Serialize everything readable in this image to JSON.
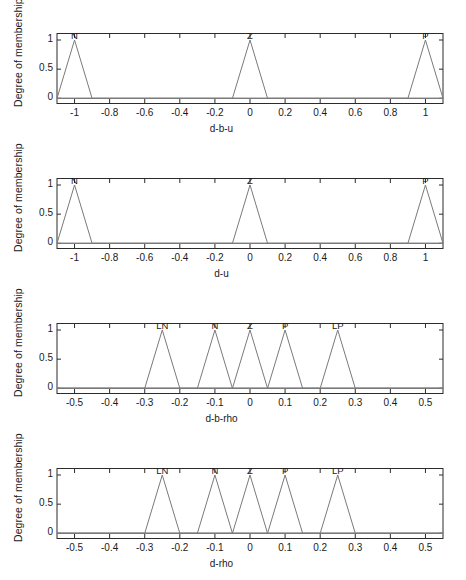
{
  "figure": {
    "background_color": "#ffffff",
    "axis_color": "#2b2b2b",
    "curve_color": "#7a7a7a",
    "baseline_color": "#9a9a9a",
    "panel_count": 4
  },
  "chart_data": [
    {
      "type": "line",
      "title": "",
      "xlabel": "d-b-u",
      "ylabel": "Degree of membership",
      "xlim": [
        -1.1,
        1.1
      ],
      "ylim": [
        -0.08,
        1.12
      ],
      "grid": false,
      "legend_position": "none",
      "xticks": [
        -1,
        -0.8,
        -0.6,
        -0.4,
        -0.2,
        0,
        0.2,
        0.4,
        0.6,
        0.8,
        1
      ],
      "xticklabels": [
        "-1",
        "-0.8",
        "-0.6",
        "-0.4",
        "-0.2",
        "0",
        "0.2",
        "0.4",
        "0.6",
        "0.8",
        "1"
      ],
      "yticks": [
        0,
        0.5,
        1
      ],
      "yticklabels": [
        "0",
        "0.5",
        "1"
      ],
      "series": [
        {
          "name": "N",
          "annotation": "N",
          "annotation_x": -1,
          "x": [
            -1.1,
            -1.0,
            -0.9,
            1.1
          ],
          "y": [
            0,
            1,
            0,
            0
          ]
        },
        {
          "name": "Z",
          "annotation": "Z",
          "annotation_x": 0,
          "x": [
            -1.1,
            -0.1,
            0.0,
            0.1,
            1.1
          ],
          "y": [
            0,
            0,
            1,
            0,
            0
          ]
        },
        {
          "name": "P",
          "annotation": "P",
          "annotation_x": 1,
          "x": [
            -1.1,
            0.9,
            1.0,
            1.1
          ],
          "y": [
            0,
            0,
            1,
            0
          ]
        }
      ]
    },
    {
      "type": "line",
      "title": "",
      "xlabel": "d-u",
      "ylabel": "Degree of membership",
      "xlim": [
        -1.1,
        1.1
      ],
      "ylim": [
        -0.08,
        1.12
      ],
      "grid": false,
      "legend_position": "none",
      "xticks": [
        -1,
        -0.8,
        -0.6,
        -0.4,
        -0.2,
        0,
        0.2,
        0.4,
        0.6,
        0.8,
        1
      ],
      "xticklabels": [
        "-1",
        "-0.8",
        "-0.6",
        "-0.4",
        "-0.2",
        "0",
        "0.2",
        "0.4",
        "0.6",
        "0.8",
        "1"
      ],
      "yticks": [
        0,
        0.5,
        1
      ],
      "yticklabels": [
        "0",
        "0.5",
        "1"
      ],
      "series": [
        {
          "name": "N",
          "annotation": "N",
          "annotation_x": -1,
          "x": [
            -1.1,
            -1.0,
            -0.9,
            1.1
          ],
          "y": [
            0,
            1,
            0,
            0
          ]
        },
        {
          "name": "Z",
          "annotation": "Z",
          "annotation_x": 0,
          "x": [
            -1.1,
            -0.1,
            0.0,
            0.1,
            1.1
          ],
          "y": [
            0,
            0,
            1,
            0,
            0
          ]
        },
        {
          "name": "P",
          "annotation": "P",
          "annotation_x": 1,
          "x": [
            -1.1,
            0.9,
            1.0,
            1.1
          ],
          "y": [
            0,
            0,
            1,
            0
          ]
        }
      ]
    },
    {
      "type": "line",
      "title": "",
      "xlabel": "d-b-rho",
      "ylabel": "Degree of membership",
      "xlim": [
        -0.55,
        0.55
      ],
      "ylim": [
        -0.08,
        1.12
      ],
      "grid": false,
      "legend_position": "none",
      "xticks": [
        -0.5,
        -0.4,
        -0.3,
        -0.2,
        -0.1,
        0,
        0.1,
        0.2,
        0.3,
        0.4,
        0.5
      ],
      "xticklabels": [
        "-0.5",
        "-0.4",
        "-0.3",
        "-0.2",
        "-0.1",
        "0",
        "0.1",
        "0.2",
        "0.3",
        "0.4",
        "0.5"
      ],
      "yticks": [
        0,
        0.5,
        1
      ],
      "yticklabels": [
        "0",
        "0.5",
        "1"
      ],
      "series": [
        {
          "name": "LN",
          "annotation": "LN",
          "annotation_x": -0.25,
          "x": [
            -0.55,
            -0.3,
            -0.25,
            -0.2,
            0.55
          ],
          "y": [
            0,
            0,
            1,
            0,
            0
          ]
        },
        {
          "name": "N",
          "annotation": "N",
          "annotation_x": -0.1,
          "x": [
            -0.55,
            -0.15,
            -0.1,
            -0.05,
            0.55
          ],
          "y": [
            0,
            0,
            1,
            0,
            0
          ]
        },
        {
          "name": "Z",
          "annotation": "Z",
          "annotation_x": 0,
          "x": [
            -0.55,
            -0.05,
            0.0,
            0.05,
            0.55
          ],
          "y": [
            0,
            0,
            1,
            0,
            0
          ]
        },
        {
          "name": "P",
          "annotation": "P",
          "annotation_x": 0.1,
          "x": [
            -0.55,
            0.05,
            0.1,
            0.15,
            0.55
          ],
          "y": [
            0,
            0,
            1,
            0,
            0
          ]
        },
        {
          "name": "LP",
          "annotation": "LP",
          "annotation_x": 0.25,
          "x": [
            -0.55,
            0.2,
            0.25,
            0.3,
            0.55
          ],
          "y": [
            0,
            0,
            1,
            0,
            0
          ]
        }
      ]
    },
    {
      "type": "line",
      "title": "",
      "xlabel": "d-rho",
      "ylabel": "Degree of membership",
      "xlim": [
        -0.55,
        0.55
      ],
      "ylim": [
        -0.08,
        1.12
      ],
      "grid": false,
      "legend_position": "none",
      "xticks": [
        -0.5,
        -0.4,
        -0.3,
        -0.2,
        -0.1,
        0,
        0.1,
        0.2,
        0.3,
        0.4,
        0.5
      ],
      "xticklabels": [
        "-0.5",
        "-0.4",
        "-0.3",
        "-0.2",
        "-0.1",
        "0",
        "0.1",
        "0.2",
        "0.3",
        "0.4",
        "0.5"
      ],
      "yticks": [
        0,
        0.5,
        1
      ],
      "yticklabels": [
        "0",
        "0.5",
        "1"
      ],
      "series": [
        {
          "name": "LN",
          "annotation": "LN",
          "annotation_x": -0.25,
          "x": [
            -0.55,
            -0.3,
            -0.25,
            -0.2,
            0.55
          ],
          "y": [
            0,
            0,
            1,
            0,
            0
          ]
        },
        {
          "name": "N",
          "annotation": "N",
          "annotation_x": -0.1,
          "x": [
            -0.55,
            -0.15,
            -0.1,
            -0.05,
            0.55
          ],
          "y": [
            0,
            0,
            1,
            0,
            0
          ]
        },
        {
          "name": "Z",
          "annotation": "Z",
          "annotation_x": 0,
          "x": [
            -0.55,
            -0.05,
            0.0,
            0.05,
            0.55
          ],
          "y": [
            0,
            0,
            1,
            0,
            0
          ]
        },
        {
          "name": "P",
          "annotation": "P",
          "annotation_x": 0.1,
          "x": [
            -0.55,
            0.05,
            0.1,
            0.15,
            0.55
          ],
          "y": [
            0,
            0,
            1,
            0,
            0
          ]
        },
        {
          "name": "LP",
          "annotation": "LP",
          "annotation_x": 0.25,
          "x": [
            -0.55,
            0.2,
            0.25,
            0.3,
            0.55
          ],
          "y": [
            0,
            0,
            1,
            0,
            0
          ]
        }
      ]
    }
  ]
}
